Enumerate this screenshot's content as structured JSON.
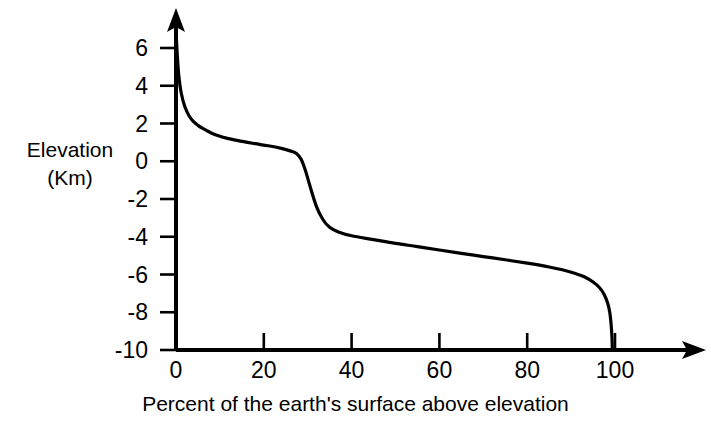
{
  "chart_data": {
    "type": "line",
    "title": "",
    "xlabel": "Percent of the earth's surface above elevation",
    "ylabel_line1": "Elevation",
    "ylabel_line2": "(Km)",
    "xlim": [
      0,
      108
    ],
    "ylim": [
      -10,
      7.6
    ],
    "grid": false,
    "legend": null,
    "x_ticks": [
      0,
      20,
      40,
      60,
      80,
      100
    ],
    "x_tick_labels": [
      "0",
      "20",
      "40",
      "60",
      "80",
      "100"
    ],
    "y_ticks": [
      6,
      4,
      2,
      0,
      -2,
      -4,
      -6,
      -8,
      -10
    ],
    "y_tick_labels": [
      "6",
      "4",
      "2",
      "0",
      "-2",
      "-4",
      "-6",
      "-8",
      "-10"
    ],
    "series": [
      {
        "name": "Hypsometric curve",
        "color": "#000000",
        "x": [
          0,
          0.3,
          0.7,
          1.2,
          2,
          3,
          4,
          5,
          6,
          8,
          10,
          12,
          15,
          18,
          21,
          24,
          26,
          27.5,
          28.5,
          29.5,
          30.5,
          32,
          33.5,
          35,
          37,
          40,
          45,
          50,
          55,
          60,
          65,
          70,
          75,
          80,
          85,
          88,
          91,
          93,
          95,
          96.5,
          97.5,
          98.3,
          98.8,
          99.1,
          99.3,
          99.4
        ],
        "y": [
          7.0,
          5.6,
          4.4,
          3.6,
          2.9,
          2.4,
          2.1,
          1.9,
          1.75,
          1.5,
          1.32,
          1.2,
          1.05,
          0.93,
          0.82,
          0.68,
          0.55,
          0.4,
          0.1,
          -0.5,
          -1.3,
          -2.4,
          -3.1,
          -3.5,
          -3.75,
          -3.95,
          -4.15,
          -4.35,
          -4.52,
          -4.7,
          -4.88,
          -5.05,
          -5.22,
          -5.4,
          -5.6,
          -5.75,
          -5.95,
          -6.12,
          -6.4,
          -6.7,
          -7.05,
          -7.5,
          -8.0,
          -8.6,
          -9.3,
          -10.0
        ]
      }
    ]
  },
  "axes": {
    "y_axis_arrow": "up-arrow",
    "x_axis_arrow": "right-arrow",
    "line_color": "#000000"
  }
}
